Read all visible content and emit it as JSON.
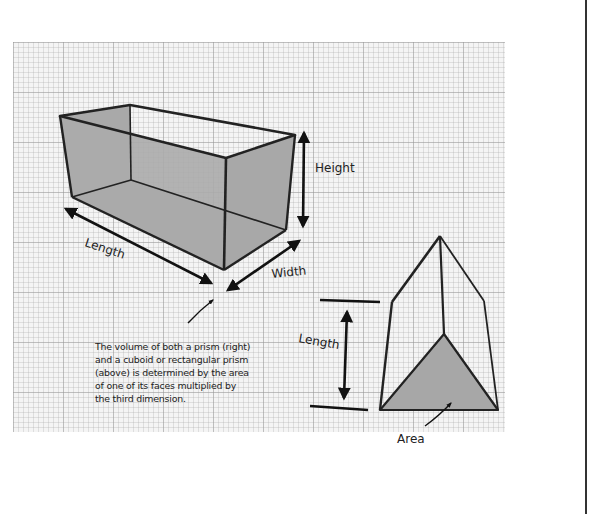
{
  "figure": {
    "background": "graph-paper",
    "colors": {
      "paper": "#f4f4f4",
      "grid_line": "#b4b4b4",
      "outline": "#222222",
      "face_fill": "#a9a9a9",
      "page_rule": "#333333"
    },
    "cuboid": {
      "name": "cuboid or rectangular prism",
      "labels": {
        "length": "Length",
        "width": "Width",
        "height": "Height"
      }
    },
    "triangular_prism": {
      "name": "prism",
      "labels": {
        "length": "Length",
        "area": "Area"
      }
    },
    "caption": "The volume of both a prism (right)\nand a cuboid or rectangular prism\n(above) is determined by the area\nof one of its faces multiplied by\nthe third dimension."
  }
}
